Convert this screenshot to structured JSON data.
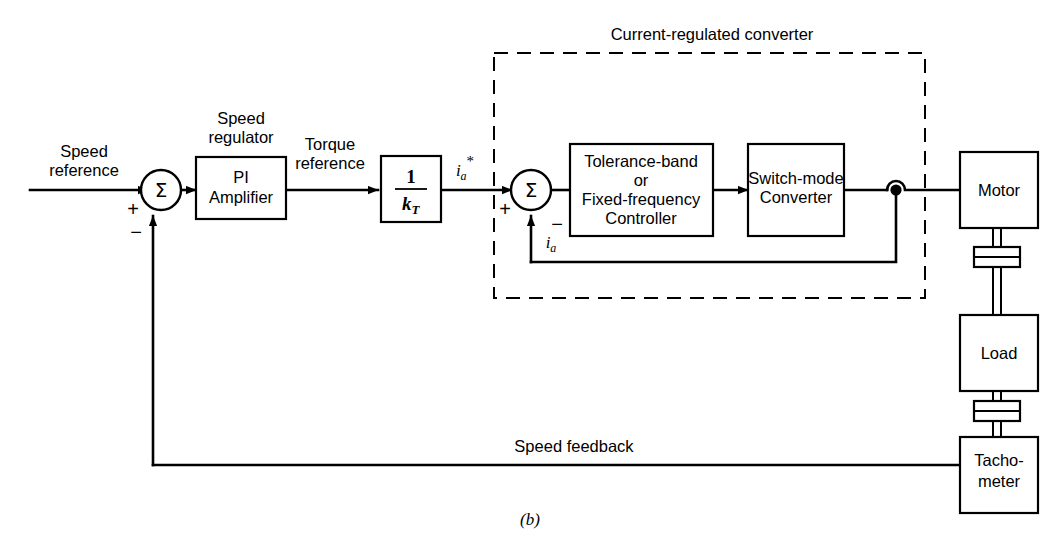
{
  "figure": {
    "caption": "(b)",
    "background_color": "#ffffff",
    "line_color": "#000000"
  },
  "signals": {
    "speed_reference": "Speed\nreference",
    "speed_reference_line1": "Speed",
    "speed_reference_line2": "reference",
    "torque_reference_line1": "Torque",
    "torque_reference_line2": "reference",
    "speed_feedback": "Speed feedback",
    "current_reference_base": "i",
    "current_reference_sub": "a",
    "current_reference_sup": "*",
    "current_feedback_base": "i",
    "current_feedback_sub": "a"
  },
  "annotations": {
    "speed_regulator_line1": "Speed",
    "speed_regulator_line2": "regulator",
    "dashed_group_label": "Current-regulated converter"
  },
  "sum_junctions": [
    {
      "name": "speed-error-summer",
      "symbol": "Σ",
      "plus": "+",
      "minus": "−"
    },
    {
      "name": "current-error-summer",
      "symbol": "Σ",
      "plus": "+",
      "minus": "−"
    }
  ],
  "blocks": {
    "pi_amplifier": {
      "line1": "PI",
      "line2": "Amplifier"
    },
    "torque_constant": {
      "numerator": "1",
      "denominator_base": "k",
      "denominator_sub": "T"
    },
    "controller": {
      "line1": "Tolerance-band",
      "line2": "or",
      "line3": "Fixed-frequency",
      "line4": "Controller"
    },
    "converter": {
      "line1": "Switch-mode",
      "line2": "Converter"
    },
    "motor": {
      "line1": "Motor"
    },
    "load": {
      "line1": "Load"
    },
    "tachometer": {
      "line1": "Tacho-",
      "line2": "meter"
    }
  }
}
